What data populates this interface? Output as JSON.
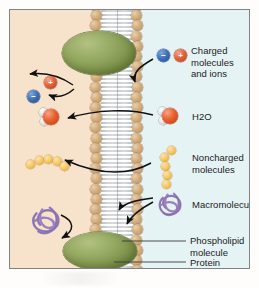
{
  "figure": {
    "compartments": {
      "outside_label": "",
      "inside_label": ""
    },
    "colors": {
      "extracellular_bg": "#f7e2cc",
      "intracellular_bg": "#e6f3f4",
      "frame_border": "#7d8488",
      "protein": "#7b9043",
      "phospholipid_head": "#d2ac7c",
      "phospholipid_tail": "#ffffff",
      "cation": "#e2603a",
      "anion": "#3c6fba",
      "water_oxygen": "#e8602f",
      "water_hydrogen": "#e2e2e2",
      "noncharged_molecule": "#f6c96a",
      "macromolecule": "#9b82bd",
      "text": "#1c1c1c"
    }
  },
  "legend": [
    {
      "id": "charged",
      "label": "Charged molecules\nand ions",
      "icon": "ion-pair-icon",
      "permeable": false
    },
    {
      "id": "water",
      "label": "H",
      "label_sub": "2",
      "label_tail": "O",
      "icon": "water-molecule-icon",
      "permeable": true
    },
    {
      "id": "noncharged",
      "label": "Noncharged\nmolecules",
      "icon": "sugar-chain-icon",
      "permeable": true
    },
    {
      "id": "macromolecule",
      "label": "Macromolecule",
      "icon": "macromolecule-icon",
      "permeable": false
    },
    {
      "id": "phospholipid",
      "label": "Phospholipid\nmolecule",
      "icon": "phospholipid-icon",
      "permeable": null
    },
    {
      "id": "protein",
      "label": "Protein",
      "icon": "membrane-protein-icon",
      "permeable": null
    }
  ],
  "structures": {
    "membrane": "phospholipid-bilayer",
    "protein_top": "integral-membrane-protein",
    "protein_bottom": "integral-membrane-protein"
  }
}
